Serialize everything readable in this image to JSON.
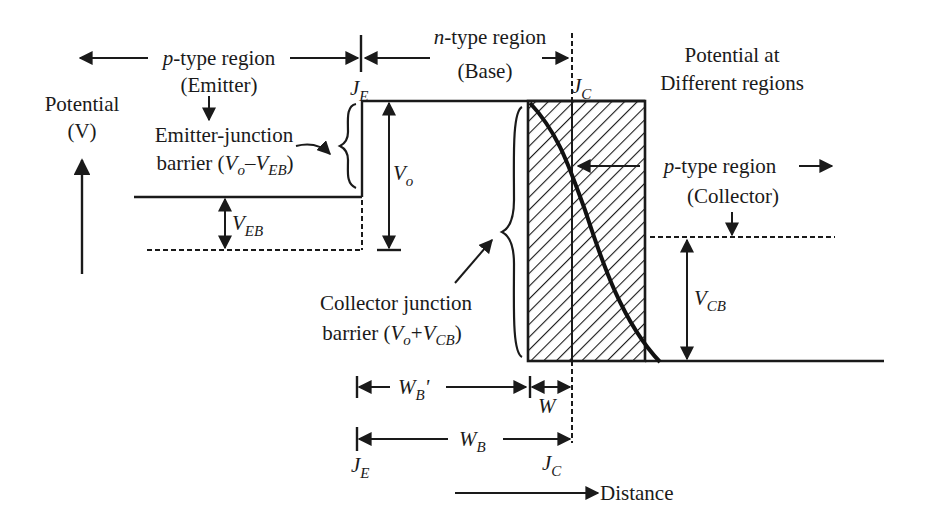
{
  "diagram": {
    "title": "Potential at Different regions",
    "title_line1": "Potential at",
    "title_line2": "Different regions",
    "axes": {
      "y_label_line1": "Potential",
      "y_label_line2": "(V)",
      "x_label": "Distance"
    },
    "regions": {
      "emitter": {
        "type": "p",
        "type_suffix": "-type region",
        "name": "(Emitter)"
      },
      "base": {
        "type": "n",
        "type_suffix": "-type region",
        "name": "(Base)"
      },
      "collector": {
        "type": "p",
        "type_suffix": "-type region",
        "name": "(Collector)"
      }
    },
    "barriers": {
      "emitter_line1": "Emitter-junction",
      "emitter_line2_prefix": "barrier (",
      "emitter_expr": {
        "a": "V",
        "a_sub": "o",
        "op": "–",
        "b": "V",
        "b_sub": "EB"
      },
      "collector_line1": "Collector junction",
      "collector_line2_prefix": "barrier (",
      "collector_expr": {
        "a": "V",
        "a_sub": "o",
        "op": "+",
        "b": "V",
        "b_sub": "CB"
      },
      "suffix": ")"
    },
    "symbols": {
      "JE": {
        "main": "J",
        "sub": "E"
      },
      "JC": {
        "main": "J",
        "sub": "C"
      },
      "Vo": {
        "main": "V",
        "sub": "o"
      },
      "VEB": {
        "main": "V",
        "sub": "EB"
      },
      "VCB": {
        "main": "V",
        "sub": "CB"
      },
      "WBprime": {
        "main": "W",
        "sub": "B",
        "prime": "'"
      },
      "W": {
        "main": "W"
      },
      "WB": {
        "main": "W",
        "sub": "B"
      }
    },
    "colors": {
      "ink": "#1a1a1a",
      "background": "#ffffff"
    }
  }
}
